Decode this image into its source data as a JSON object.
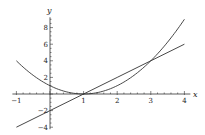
{
  "chart_data": {
    "type": "line",
    "title": "",
    "xlabel": "x",
    "ylabel": "y",
    "xlim": [
      -1,
      4
    ],
    "ylim": [
      -4,
      9
    ],
    "xticks": [
      -1,
      1,
      2,
      3,
      4
    ],
    "yticks": [
      -4,
      -2,
      2,
      4,
      6,
      8
    ],
    "grid": false,
    "legend": null,
    "series": [
      {
        "name": "y = (x-1)^2",
        "x": [
          -1,
          -0.5,
          0,
          0.5,
          1,
          1.5,
          2,
          2.5,
          3,
          3.5,
          4
        ],
        "values": [
          4,
          2.25,
          1,
          0.25,
          0,
          0.25,
          1,
          2.25,
          4,
          6.25,
          9
        ]
      },
      {
        "name": "y = 2x - 2",
        "x": [
          -1,
          0,
          1,
          2,
          3,
          4
        ],
        "values": [
          -4,
          -2,
          0,
          2,
          4,
          6
        ]
      }
    ],
    "annotations": []
  },
  "layout": {
    "x0px": 50,
    "xScale": 33.6,
    "y0px": 94,
    "yScale": 8.3
  }
}
